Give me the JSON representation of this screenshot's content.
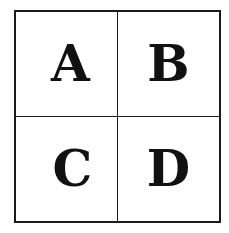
{
  "diagram": {
    "type": "2x2 grid",
    "cells": [
      {
        "label": "A",
        "row": 0,
        "col": 0
      },
      {
        "label": "B",
        "row": 0,
        "col": 1
      },
      {
        "label": "C",
        "row": 1,
        "col": 0
      },
      {
        "label": "D",
        "row": 1,
        "col": 1
      }
    ],
    "colors": {
      "line": "#1a1a1a",
      "text": "#111111",
      "background": "#ffffff"
    }
  }
}
